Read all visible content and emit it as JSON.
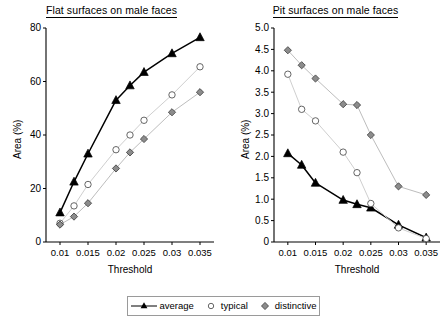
{
  "figure": {
    "legend": {
      "position": "bottom-center",
      "entries": [
        {
          "label": "average",
          "marker": "filled-triangle",
          "marker_color": "#000000",
          "line": true
        },
        {
          "label": "typical",
          "marker": "open-circle",
          "marker_color": "#ffffff",
          "line": false
        },
        {
          "label": "distinctive",
          "marker": "gray-diamond",
          "marker_color": "#8c8c8c",
          "line": false
        }
      ]
    }
  },
  "chart_data": [
    {
      "id": "flat-surfaces",
      "type": "line",
      "title": "Flat surfaces on male faces",
      "xlabel": "Threshold",
      "ylabel": "Area (%)",
      "x": [
        0.01,
        0.0125,
        0.015,
        0.02,
        0.0225,
        0.025,
        0.03,
        0.035
      ],
      "xlim": [
        0.0075,
        0.0375
      ],
      "ylim": [
        0,
        80
      ],
      "xticks": [
        0.01,
        0.015,
        0.02,
        0.025,
        0.03,
        0.035
      ],
      "xticklabels": [
        "0.01",
        "0.015",
        "0.02",
        "0.025",
        "0.03",
        "0.035"
      ],
      "yticks": [
        0,
        20,
        40,
        60,
        80
      ],
      "yticklabels": [
        "0",
        "20",
        "40",
        "60",
        "80"
      ],
      "grid": false,
      "series": [
        {
          "name": "average",
          "marker": "filled-triangle",
          "values": [
            11.0,
            22.5,
            33.0,
            53.0,
            58.5,
            63.5,
            70.5,
            76.5
          ]
        },
        {
          "name": "typical",
          "marker": "open-circle",
          "values": [
            7.0,
            13.5,
            21.5,
            34.5,
            40.0,
            45.5,
            55.0,
            65.5
          ]
        },
        {
          "name": "distinctive",
          "marker": "gray-diamond",
          "values": [
            6.5,
            9.5,
            14.5,
            27.5,
            33.5,
            38.5,
            48.5,
            56.0
          ]
        }
      ]
    },
    {
      "id": "pit-surfaces",
      "type": "line",
      "title": "Pit surfaces on male faces",
      "xlabel": "Threshold",
      "ylabel": "Area (%)",
      "x": [
        0.01,
        0.0125,
        0.015,
        0.02,
        0.0225,
        0.025,
        0.03,
        0.035
      ],
      "xlim": [
        0.0075,
        0.0375
      ],
      "ylim": [
        0,
        5.0
      ],
      "xticks": [
        0.01,
        0.015,
        0.02,
        0.025,
        0.03,
        0.035
      ],
      "xticklabels": [
        "0.01",
        "0.015",
        "0.02",
        "0.025",
        "0.03",
        "0.035"
      ],
      "yticks": [
        0,
        0.5,
        1.0,
        1.5,
        2.0,
        2.5,
        3.0,
        3.5,
        4.0,
        4.5,
        5.0
      ],
      "yticklabels": [
        "0",
        "0.5",
        "1.0",
        "1.5",
        "2.0",
        "2.5",
        "3.0",
        "3.5",
        "4.0",
        "4.5",
        "5.0"
      ],
      "grid": false,
      "series": [
        {
          "name": "average",
          "marker": "filled-triangle",
          "values": [
            2.07,
            1.8,
            1.38,
            0.98,
            0.88,
            0.8,
            0.4,
            0.1
          ]
        },
        {
          "name": "typical",
          "marker": "open-circle",
          "values": [
            3.92,
            3.1,
            2.83,
            2.1,
            1.62,
            0.9,
            0.33,
            0.08
          ]
        },
        {
          "name": "distinctive",
          "marker": "gray-diamond",
          "values": [
            4.48,
            4.13,
            3.82,
            3.22,
            3.2,
            2.5,
            1.3,
            1.1
          ]
        }
      ]
    }
  ]
}
